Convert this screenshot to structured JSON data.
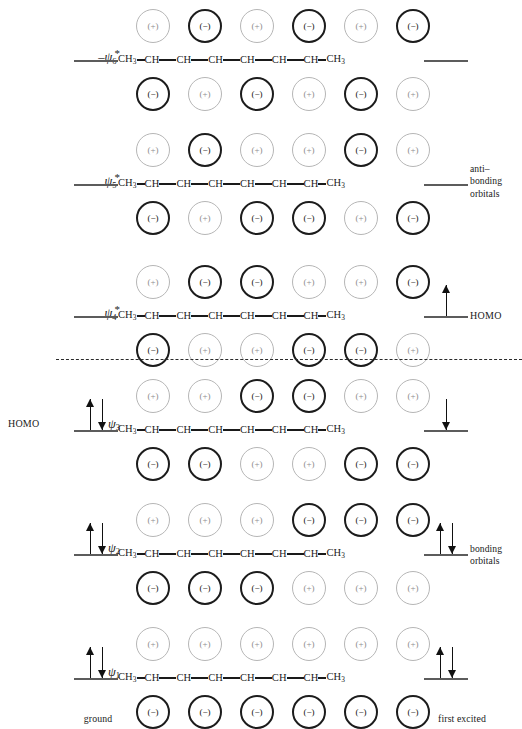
{
  "figure": {
    "divider_style": "dashed",
    "chain_formula": [
      "CH3",
      "CH",
      "CH",
      "CH",
      "CH",
      "CH",
      "CH",
      "CH3"
    ],
    "colors": {
      "light_lobe_stroke": "#b6b6b6",
      "dark_lobe_stroke": "#1c1c1c",
      "level_line": "#5c5c5c",
      "arrow": "#111111",
      "text": "#1a1a1a"
    }
  },
  "page_artifact": "",
  "captions": {
    "antibonding": "anti–\nbonding\norbitals",
    "antibonding_lines": [
      "anti–",
      "bonding",
      "orbitals"
    ],
    "bonding": "bonding\norbitals",
    "bonding_lines": [
      "bonding",
      "orbitals"
    ],
    "ground": "ground",
    "first_excited": "first  excited"
  },
  "chart_data": {
    "type": "diagram",
    "orbital_count": 6,
    "lobes_per_orbital": 6,
    "orbitals": [
      {
        "id": "psi6",
        "symbol": "ψ",
        "subscript": "6",
        "star": "*",
        "prefix": "–",
        "label_left": "",
        "label_right": "",
        "top_phases": [
          "+",
          "−",
          "+",
          "−",
          "+",
          "−"
        ],
        "bottom_phases": [
          "−",
          "+",
          "−",
          "+",
          "−",
          "+"
        ],
        "top_shades": [
          "light",
          "dark",
          "light",
          "dark",
          "light",
          "dark"
        ],
        "bottom_shades": [
          "dark",
          "light",
          "dark",
          "light",
          "dark",
          "light"
        ],
        "ground_electrons": "",
        "excited_electrons": "",
        "nodes": 5,
        "type": "antibonding"
      },
      {
        "id": "psi5",
        "symbol": "ψ",
        "subscript": "5",
        "star": "*",
        "prefix": "",
        "label_left": "",
        "label_right": "",
        "top_phases": [
          "+",
          "−",
          "+",
          "+",
          "−",
          "+"
        ],
        "bottom_phases": [
          "−",
          "+",
          "−",
          "−",
          "+",
          "−"
        ],
        "top_shades": [
          "light",
          "dark",
          "light",
          "light",
          "dark",
          "light"
        ],
        "bottom_shades": [
          "dark",
          "light",
          "dark",
          "dark",
          "light",
          "dark"
        ],
        "ground_electrons": "",
        "excited_electrons": "",
        "nodes": 4,
        "type": "antibonding"
      },
      {
        "id": "psi4",
        "symbol": "ψ",
        "subscript": "4",
        "star": "*",
        "prefix": "",
        "label_left": "",
        "label_right": "HOMO",
        "top_phases": [
          "+",
          "−",
          "−",
          "+",
          "+",
          "−"
        ],
        "bottom_phases": [
          "−",
          "+",
          "+",
          "−",
          "−",
          "+"
        ],
        "top_shades": [
          "light",
          "dark",
          "dark",
          "light",
          "light",
          "dark"
        ],
        "bottom_shades": [
          "dark",
          "light",
          "light",
          "dark",
          "dark",
          "light"
        ],
        "ground_electrons": "",
        "excited_electrons": "up",
        "nodes": 3,
        "type": "antibonding"
      },
      {
        "id": "psi3",
        "symbol": "ψ",
        "subscript": "3",
        "star": "",
        "prefix": "",
        "label_left": "HOMO",
        "label_right": "",
        "top_phases": [
          "+",
          "+",
          "−",
          "−",
          "+",
          "+"
        ],
        "bottom_phases": [
          "−",
          "−",
          "+",
          "+",
          "−",
          "−"
        ],
        "top_shades": [
          "light",
          "light",
          "dark",
          "dark",
          "light",
          "light"
        ],
        "bottom_shades": [
          "dark",
          "dark",
          "light",
          "light",
          "dark",
          "dark"
        ],
        "ground_electrons": "pair",
        "excited_electrons": "down",
        "nodes": 2,
        "type": "bonding"
      },
      {
        "id": "psi2",
        "symbol": "ψ",
        "subscript": "2",
        "star": "",
        "prefix": "",
        "label_left": "",
        "label_right": "",
        "top_phases": [
          "+",
          "+",
          "+",
          "−",
          "−",
          "−"
        ],
        "bottom_phases": [
          "−",
          "−",
          "−",
          "+",
          "+",
          "+"
        ],
        "top_shades": [
          "light",
          "light",
          "light",
          "dark",
          "dark",
          "dark"
        ],
        "bottom_shades": [
          "dark",
          "dark",
          "dark",
          "light",
          "light",
          "light"
        ],
        "ground_electrons": "pair",
        "excited_electrons": "pair",
        "nodes": 1,
        "type": "bonding"
      },
      {
        "id": "psi1",
        "symbol": "ψ",
        "subscript": "1",
        "star": "",
        "prefix": "",
        "label_left": "",
        "label_right": "",
        "top_phases": [
          "+",
          "+",
          "+",
          "+",
          "+",
          "+"
        ],
        "bottom_phases": [
          "−",
          "−",
          "−",
          "−",
          "−",
          "−"
        ],
        "top_shades": [
          "light",
          "light",
          "light",
          "light",
          "light",
          "light"
        ],
        "bottom_shades": [
          "dark",
          "dark",
          "dark",
          "dark",
          "dark",
          "dark"
        ],
        "ground_electrons": "pair",
        "excited_electrons": "pair",
        "nodes": 0,
        "type": "bonding"
      }
    ]
  }
}
